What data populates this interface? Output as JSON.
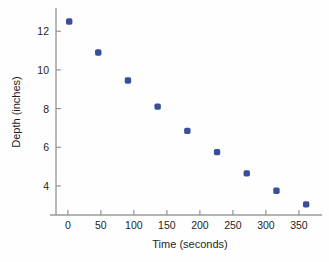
{
  "chart_data": {
    "type": "scatter",
    "title": "",
    "xlabel": "Time (seconds)",
    "ylabel": "Depth (inches)",
    "xlim": [
      -18,
      385
    ],
    "ylim": [
      2.5,
      13.2
    ],
    "xticks": [
      0,
      50,
      100,
      150,
      200,
      250,
      300,
      350
    ],
    "yticks": [
      4,
      6,
      8,
      10,
      12
    ],
    "xtick_labels": [
      "0",
      "50",
      "100",
      "150",
      "200",
      "250",
      "300",
      "350"
    ],
    "ytick_labels": [
      "4",
      "6",
      "8",
      "10",
      "12"
    ],
    "grid": false,
    "legend": null,
    "marker_color": "#3a4f9c",
    "marker_size": 3.2,
    "series": [
      {
        "name": "Depth vs Time",
        "x": [
          2,
          46,
          91,
          136,
          181,
          226,
          271,
          316,
          361
        ],
        "y": [
          12.5,
          10.9,
          9.45,
          8.1,
          6.85,
          5.75,
          4.65,
          3.75,
          3.05
        ]
      }
    ]
  },
  "figure": {
    "background_color": "#fefefe",
    "axis_color": "#9a9a9a",
    "text_color": "#1f1f1f"
  }
}
